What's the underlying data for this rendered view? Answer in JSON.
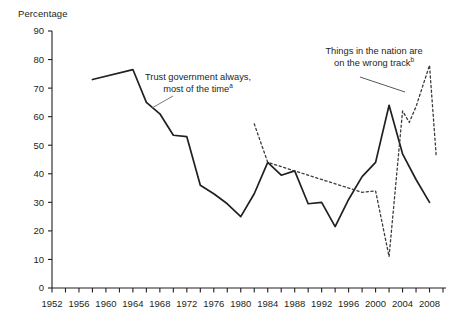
{
  "chart_data": {
    "type": "line",
    "title": "",
    "ylabel": "Percentage",
    "xlabel": "",
    "ylim": [
      0,
      90
    ],
    "ytick_step": 10,
    "yticks": [
      "0",
      "10",
      "20",
      "30",
      "40",
      "50",
      "60",
      "70",
      "80",
      "90"
    ],
    "xlim": [
      1952,
      2010
    ],
    "xtick_step": 2,
    "xticks_labeled": [
      "1952",
      "1956",
      "1960",
      "1964",
      "1968",
      "1972",
      "1976",
      "1980",
      "1984",
      "1988",
      "1992",
      "1996",
      "2000",
      "2004",
      "2008"
    ],
    "grid": false,
    "legend": "annotations",
    "series": [
      {
        "name": "Trust government always, most of the time",
        "note": "a",
        "style": "solid",
        "color": "#231f20",
        "points": [
          [
            1958,
            73.0
          ],
          [
            1964,
            76.5
          ],
          [
            1966,
            65.0
          ],
          [
            1968,
            61.0
          ],
          [
            1970,
            53.5
          ],
          [
            1972,
            53.0
          ],
          [
            1974,
            36.0
          ],
          [
            1976,
            33.0
          ],
          [
            1978,
            29.5
          ],
          [
            1980,
            25.0
          ],
          [
            1982,
            33.0
          ],
          [
            1984,
            44.0
          ],
          [
            1986,
            39.5
          ],
          [
            1988,
            41.0
          ],
          [
            1990,
            29.5
          ],
          [
            1992,
            30.0
          ],
          [
            1994,
            21.5
          ],
          [
            1996,
            31.0
          ],
          [
            1998,
            39.0
          ],
          [
            2000,
            44.0
          ],
          [
            2002,
            64.0
          ],
          [
            2004,
            47.0
          ],
          [
            2006,
            38.0
          ],
          [
            2008,
            30.0
          ]
        ]
      },
      {
        "name": "Things in the nation are on the wrong track",
        "note": "b",
        "style": "dashed",
        "color": "#3c3a3b",
        "points": [
          [
            1982,
            57.5
          ],
          [
            1984,
            44.0
          ],
          [
            1998,
            33.5
          ],
          [
            2000,
            34.0
          ],
          [
            2002,
            11.0
          ],
          [
            2004,
            62.0
          ],
          [
            2005,
            58.0
          ],
          [
            2006,
            63.5
          ],
          [
            2008,
            78.0
          ],
          [
            2009,
            46.0
          ]
        ]
      }
    ],
    "annotations": [
      {
        "id": "trust",
        "line1": "Trust government always,",
        "line2": "most of the time",
        "superscript": "a"
      },
      {
        "id": "track",
        "line1": "Things in the nation are",
        "line2": "on the wrong track",
        "superscript": "b"
      }
    ]
  },
  "axis": {
    "y_title": "Percentage"
  }
}
